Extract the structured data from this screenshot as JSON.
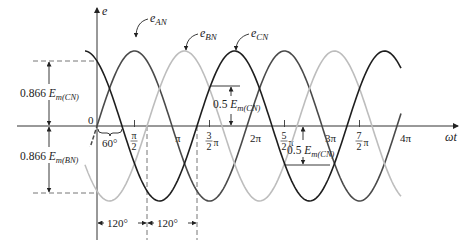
{
  "diagram": {
    "axes": {
      "y_label": "e",
      "x_label": "ωt",
      "origin_label": "0",
      "x_ticks": [
        {
          "label_num": "π",
          "label_den": "2",
          "frac": true,
          "value_pi": 0.5
        },
        {
          "label": "π",
          "frac": false,
          "value_pi": 1.0
        },
        {
          "label_num": "3",
          "label_den": "2",
          "suffix": "π",
          "frac": true,
          "value_pi": 1.5
        },
        {
          "label": "2π",
          "frac": false,
          "value_pi": 2.0
        },
        {
          "label_num": "5",
          "label_den": "2",
          "suffix": "π",
          "frac": true,
          "value_pi": 2.5
        },
        {
          "label": "3π",
          "frac": false,
          "value_pi": 3.0
        },
        {
          "label_num": "7",
          "label_den": "2",
          "suffix": "π",
          "frac": true,
          "value_pi": 3.5
        },
        {
          "label": "4π",
          "frac": false,
          "value_pi": 4.0
        }
      ]
    },
    "curves": [
      {
        "name": "e_AN",
        "label_main": "e",
        "label_sub": "AN",
        "phase_deg": 0,
        "color": "#4a4a4a"
      },
      {
        "name": "e_BN",
        "label_main": "e",
        "label_sub": "BN",
        "phase_deg": -120,
        "color": "#bdbdbd"
      },
      {
        "name": "e_CN",
        "label_main": "e",
        "label_sub": "CN",
        "phase_deg": 120,
        "color": "#1e1e1e"
      }
    ],
    "annotations": {
      "upper_dim": {
        "coef": "0.866",
        "E": "E",
        "sub": "m(CN)"
      },
      "lower_dim": {
        "coef": "0.866",
        "E": "E",
        "sub": "m(BN)"
      },
      "half_upper": {
        "coef": "0.5",
        "E": "E",
        "sub": "m(CN)"
      },
      "half_lower": {
        "coef": "0.5",
        "E": "E",
        "sub": "m(CN)"
      },
      "angle_60": "60°",
      "angle_120_a": "120°",
      "angle_120_b": "120°"
    }
  }
}
